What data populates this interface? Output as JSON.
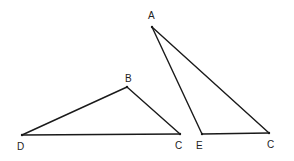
{
  "diagram": {
    "type": "geometry",
    "stroke_color": "#1a1a1a",
    "label_color": "#222222",
    "triangles": [
      {
        "name": "triangle-DBC",
        "vertices": [
          {
            "label": "D",
            "x": 22,
            "y": 135,
            "lx": 17,
            "ly": 150
          },
          {
            "label": "B",
            "x": 127,
            "y": 87,
            "lx": 125,
            "ly": 81
          },
          {
            "label": "C",
            "x": 180,
            "y": 134,
            "lx": 175,
            "ly": 149
          }
        ]
      },
      {
        "name": "triangle-AEC",
        "vertices": [
          {
            "label": "A",
            "x": 152,
            "y": 27,
            "lx": 148,
            "ly": 18
          },
          {
            "label": "E",
            "x": 202,
            "y": 134,
            "lx": 196,
            "ly": 149
          },
          {
            "label": "C",
            "x": 269,
            "y": 133,
            "lx": 267,
            "ly": 148
          }
        ]
      }
    ],
    "labels": {
      "A": "A",
      "B": "B",
      "C1": "C",
      "D": "D",
      "E": "E",
      "C2": "C"
    }
  }
}
